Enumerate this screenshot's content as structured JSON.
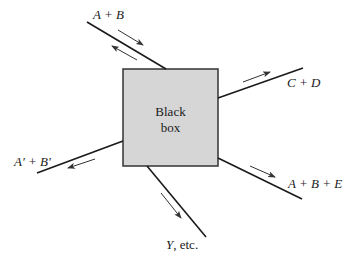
{
  "diagram": {
    "type": "black-box flow diagram",
    "background": "#ffffff",
    "box": {
      "label_line1": "Black",
      "label_line2": "box",
      "fill": "#d6d6d6",
      "stroke": "#333333"
    },
    "streams": [
      {
        "id": "inlet-a-b",
        "label": "A + B",
        "direction": "bidirectional (in and out)"
      },
      {
        "id": "outlet-c-d",
        "label": "C + D",
        "direction": "out"
      },
      {
        "id": "outlet-a-b-e",
        "label": "A + B + E",
        "direction": "out"
      },
      {
        "id": "outlet-y",
        "label_var": "Y",
        "label_rest": ", etc.",
        "direction": "out"
      },
      {
        "id": "outlet-a-prime-b-prime",
        "label": "A′ + B′",
        "direction": "out"
      }
    ]
  }
}
